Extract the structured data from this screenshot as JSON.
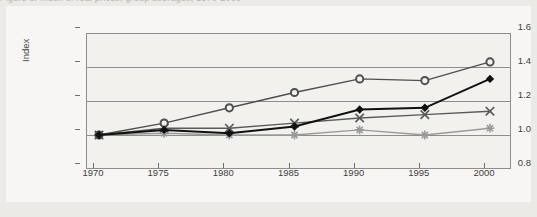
{
  "figure": {
    "clipped_title": "Figure 3. Index of real prices, group averages, 1970-2000"
  },
  "axes": {
    "ylabel": "Index",
    "ytick_labels": [
      "1.6",
      "1.4",
      "1.2",
      "1.0",
      "0.8"
    ],
    "xtick_labels": [
      "1970",
      "1975",
      "1980",
      "1985",
      "1990",
      "1995",
      "2000"
    ]
  },
  "colors": {
    "page_background": "#eceae6",
    "panel_background": "#f7f6f4",
    "plot_background": "#f2f1ee",
    "axis": "#8d8d8d",
    "series_circle": "#4f4f4f",
    "series_diamond": "#111111",
    "series_x": "#5a5a5a",
    "series_star": "#9a9a9a"
  },
  "chart_data": {
    "type": "line",
    "xlabel": "",
    "ylabel": "Index",
    "x": [
      1970,
      1975,
      1980,
      1985,
      1990,
      1995,
      2000
    ],
    "xlim": [
      1970,
      2000
    ],
    "ylim": [
      0.8,
      1.6
    ],
    "yticks": [
      0.8,
      1.0,
      1.2,
      1.4,
      1.6
    ],
    "grid": true,
    "legend": "none",
    "series": [
      {
        "name": "Series 1",
        "marker": "circle",
        "color": "#4f4f4f",
        "values": [
          1.0,
          1.07,
          1.16,
          1.25,
          1.33,
          1.32,
          1.43
        ]
      },
      {
        "name": "Series 2",
        "marker": "diamond",
        "color": "#111111",
        "values": [
          1.0,
          1.03,
          1.01,
          1.05,
          1.15,
          1.16,
          1.33
        ]
      },
      {
        "name": "Series 3",
        "marker": "x",
        "color": "#5a5a5a",
        "values": [
          1.0,
          1.04,
          1.04,
          1.07,
          1.1,
          1.12,
          1.14
        ]
      },
      {
        "name": "Series 4",
        "marker": "star",
        "color": "#9a9a9a",
        "values": [
          1.0,
          1.01,
          1.0,
          1.0,
          1.03,
          1.0,
          1.04
        ]
      }
    ]
  }
}
